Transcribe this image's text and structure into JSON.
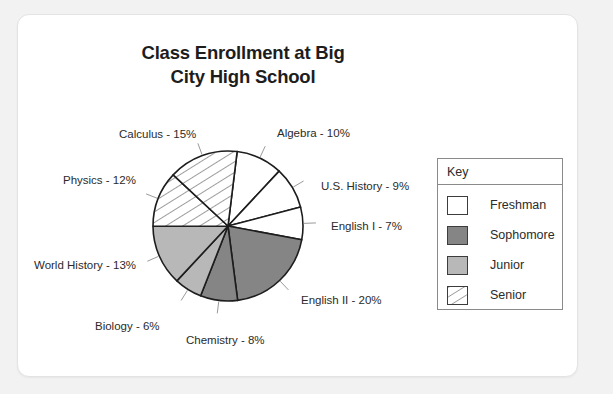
{
  "card": {
    "name": "chart-card"
  },
  "chart_data": {
    "type": "pie",
    "title": "Class Enrollment at Big City High School",
    "title_line1": "Class Enrollment at Big",
    "title_line2": "City High School",
    "xlabel": "",
    "ylabel": "",
    "legend_position": "right",
    "legend_title": "Key",
    "grid": false,
    "categories": [
      "Algebra",
      "U.S. History",
      "English I",
      "English II",
      "Chemistry",
      "Biology",
      "World History",
      "Physics",
      "Calculus"
    ],
    "values": [
      10,
      9,
      7,
      20,
      8,
      6,
      13,
      12,
      15
    ],
    "units": "percent",
    "slices": [
      {
        "label": "Algebra - 10%",
        "name": "Algebra",
        "value": 10,
        "group": "Freshman",
        "fill": "#ffffff",
        "pattern": "solid"
      },
      {
        "label": "U.S. History - 9%",
        "name": "U.S. History",
        "value": 9,
        "group": "Freshman",
        "fill": "#ffffff",
        "pattern": "solid"
      },
      {
        "label": "English I - 7%",
        "name": "English I",
        "value": 7,
        "group": "Freshman",
        "fill": "#ffffff",
        "pattern": "solid"
      },
      {
        "label": "English II - 20%",
        "name": "English II",
        "value": 20,
        "group": "Sophomore",
        "fill": "#858585",
        "pattern": "solid"
      },
      {
        "label": "Chemistry - 8%",
        "name": "Chemistry",
        "value": 8,
        "group": "Sophomore",
        "fill": "#858585",
        "pattern": "solid"
      },
      {
        "label": "Biology - 6%",
        "name": "Biology",
        "value": 6,
        "group": "Junior",
        "fill": "#b8b8b8",
        "pattern": "solid"
      },
      {
        "label": "World History - 13%",
        "name": "World History",
        "value": 13,
        "group": "Junior",
        "fill": "#b8b8b8",
        "pattern": "solid"
      },
      {
        "label": "Physics - 12%",
        "name": "Physics",
        "value": 12,
        "group": "Senior",
        "fill": "#ffffff",
        "pattern": "diagonal-hatch"
      },
      {
        "label": "Calculus - 15%",
        "name": "Calculus",
        "value": 15,
        "group": "Senior",
        "fill": "#ffffff",
        "pattern": "diagonal-hatch"
      }
    ],
    "legend": [
      {
        "label": "Freshman",
        "fill": "#ffffff",
        "pattern": "solid"
      },
      {
        "label": "Sophomore",
        "fill": "#858585",
        "pattern": "solid"
      },
      {
        "label": "Junior",
        "fill": "#b8b8b8",
        "pattern": "solid"
      },
      {
        "label": "Senior",
        "fill": "#ffffff",
        "pattern": "diagonal-hatch"
      }
    ],
    "start_angle_deg": -83,
    "direction": "clockwise",
    "center": {
      "x": 228,
      "y": 226
    },
    "radius": 75,
    "colors": {
      "freshman": "#ffffff",
      "sophomore": "#858585",
      "junior": "#b8b8b8",
      "senior_hatch": "#ffffff",
      "outline": "#1d1d1d",
      "text": "#2b2b2b",
      "card_bg": "#ffffff",
      "page_bg": "#f2f2f2"
    }
  },
  "labels": [
    {
      "text": "Calculus - 15%",
      "left": 119,
      "top": 128
    },
    {
      "text": "Physics - 12%",
      "left": 63,
      "top": 174
    },
    {
      "text": "World History - 13%",
      "left": 34,
      "top": 259
    },
    {
      "text": "Biology - 6%",
      "left": 95,
      "top": 320
    },
    {
      "text": "Chemistry - 8%",
      "left": 186,
      "top": 334
    },
    {
      "text": "English II - 20%",
      "left": 301,
      "top": 294
    },
    {
      "text": "English I - 7%",
      "left": 331,
      "top": 220
    },
    {
      "text": "U.S. History - 9%",
      "left": 321,
      "top": 180
    },
    {
      "text": "Algebra - 10%",
      "left": 277,
      "top": 127
    }
  ]
}
